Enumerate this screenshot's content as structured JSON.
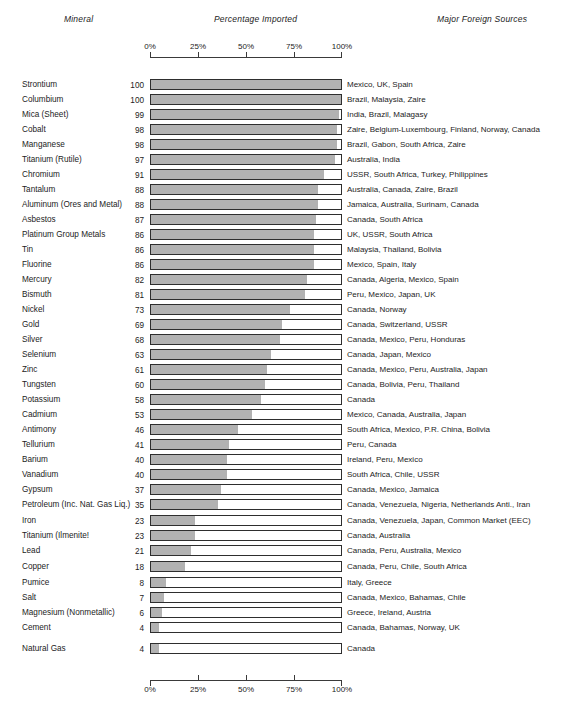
{
  "headers": {
    "mineral": "Mineral",
    "percentage": "Percentage Imported",
    "sources": "Major Foreign Sources"
  },
  "axis": {
    "ticks": [
      "0%",
      "25%",
      "50%",
      "75%",
      "100%"
    ],
    "values": [
      0,
      25,
      50,
      75,
      100
    ]
  },
  "colors": {
    "bar_fill": "#b2b2b2",
    "bar_outline": "#2e2e2e",
    "text": "#1c1c1c"
  },
  "chart_data": {
    "type": "bar",
    "title": "Percentage Imported",
    "xlabel": "Percentage Imported",
    "ylabel": "Mineral",
    "xlim": [
      0,
      100
    ],
    "grid": false,
    "orientation": "horizontal",
    "legend": "none",
    "categories": [
      "Strontium",
      "Columbium",
      "Mica (Sheet)",
      "Cobalt",
      "Manganese",
      "Titanium (Rutile)",
      "Chromium",
      "Tantalum",
      "Aluminum (Ores and Metal)",
      "Asbestos",
      "Platinum Group Metals",
      "Tin",
      "Fluorine",
      "Mercury",
      "Bismuth",
      "Nickel",
      "Gold",
      "Silver",
      "Selenium",
      "Zinc",
      "Tungsten",
      "Potassium",
      "Cadmium",
      "Antimony",
      "Tellurium",
      "Barium",
      "Vanadium",
      "Gypsum",
      "Petroleum (Inc. Nat. Gas Liq.)",
      "Iron",
      "Titanium (Ilmenite!",
      "Lead",
      "Copper",
      "Pumice",
      "Salt",
      "Magnesium (Nonmetallic)",
      "Cement",
      "Natural Gas"
    ],
    "values": [
      100,
      100,
      99,
      98,
      98,
      97,
      91,
      88,
      88,
      87,
      86,
      86,
      86,
      82,
      81,
      73,
      69,
      68,
      63,
      61,
      60,
      58,
      53,
      46,
      41,
      40,
      40,
      37,
      35,
      23,
      23,
      21,
      18,
      8,
      7,
      6,
      4,
      4
    ],
    "annotations": [
      "Mexico, UK, Spain",
      "Brazil, Malaysia, Zaire",
      "India, Brazil, Malagasy",
      "Zaire, Belgium-Luxembourg, Finland, Norway, Canada",
      "Brazil, Gabon, South Africa, Zaire",
      "Australia, India",
      "USSR, South Africa, Turkey, Philippines",
      "Australia, Canada, Zaire, Brazil",
      "Jamaica, Australia, Surinam, Canada",
      "Canada, South Africa",
      "UK, USSR, South Africa",
      "Malaysia, Thailand, Bolivia",
      "Mexico, Spain, Italy",
      "Canada, Algeria, Mexico, Spain",
      "Peru, Mexico, Japan, UK",
      "Canada, Norway",
      "Canada, Switzerland, USSR",
      "Canada, Mexico, Peru, Honduras",
      "Canada, Japan, Mexico",
      "Canada, Mexico, Peru, Australia, Japan",
      "Canada, Bolivia, Peru, Thailand",
      "Canada",
      "Mexico, Canada, Australia, Japan",
      "South Africa, Mexico, P.R. China, Bolivia",
      "Peru, Canada",
      "Ireland, Peru, Mexico",
      "South Africa, Chile, USSR",
      "Canada, Mexico, Jamaica",
      "Canada, Venezuela, Nigeria, Netherlands Anti., Iran",
      "Canada, Venezuela, Japan, Common Market (EEC)",
      "Canada, Australia",
      "Canada, Peru, Australia, Mexico",
      "Canada, Peru, Chile, South Africa",
      "Italy, Greece",
      "Canada, Mexico, Bahamas, Chile",
      "Greece, Ireland, Austria",
      "Canada, Bahamas, Norway, UK",
      "Canada"
    ]
  }
}
